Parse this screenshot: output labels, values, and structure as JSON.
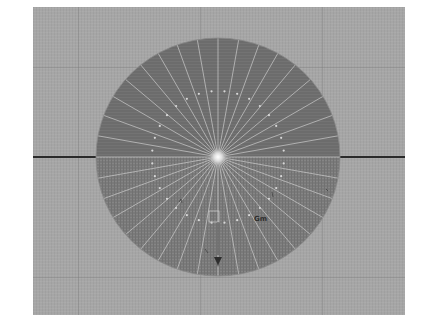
{
  "viewport": {
    "background_color": "#a6a6a6",
    "disc_upper_color": "#6c6c6c",
    "disc_lower_color": "#7a7a7a",
    "ray_color": "#cfcfcf",
    "dot_color": "#d8d8d8",
    "horizon_color": "#2a2a2a",
    "ray_count": 36,
    "dot_count": 32,
    "grid_lines_x": [
      45,
      167,
      289
    ],
    "grid_lines_y": [
      60,
      270
    ]
  },
  "disc": {
    "center_x": 185,
    "center_y": 150,
    "radius_x": 122,
    "radius_y": 119,
    "dot_ring_radius": 66
  },
  "marks": {
    "right_mark": "Gm",
    "bottom_marker": "▼"
  }
}
